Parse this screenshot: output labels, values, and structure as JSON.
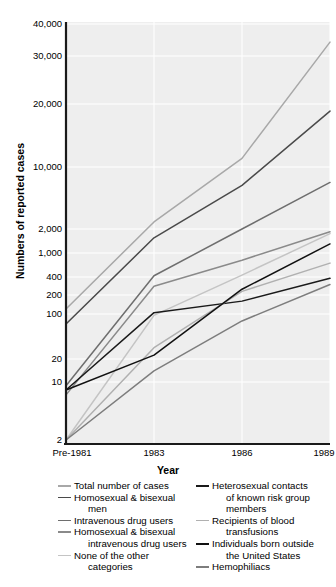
{
  "chart": {
    "ylabel": "Numbers of reported cases",
    "xlabel": "Year",
    "y_ticks": [
      "40,000",
      "30,000",
      "20,000",
      "10,000",
      "2,000",
      "1,000",
      "400",
      "200",
      "100",
      "20",
      "10",
      "2"
    ],
    "x_ticks": [
      "Pre-1981",
      "1983",
      "1986",
      "1989"
    ]
  },
  "legend": {
    "left": [
      {
        "label": "Total number of cases",
        "cont": "",
        "color": "#a8a8a8"
      },
      {
        "label": "Homosexual & bisexual",
        "cont": "men",
        "color": "#4a4a4a"
      },
      {
        "label": "Intravenous drug users",
        "cont": "",
        "color": "#6e6e6e"
      },
      {
        "label": "Homosexual & bisexual",
        "cont": "intravenous drug users",
        "color": "#8a8a8a"
      },
      {
        "label": "None of the other",
        "cont": "categories",
        "color": "#c4c4c4"
      }
    ],
    "right": [
      {
        "label": "Heterosexual contacts",
        "cont": "of known risk group|members",
        "color": "#1a1a1a"
      },
      {
        "label": "Recipients of blood",
        "cont": "transfusions",
        "color": "#b0b0b0"
      },
      {
        "label": "Individuals born outside",
        "cont": "the United States",
        "color": "#111111"
      },
      {
        "label": "Hemophiliacs",
        "cont": "",
        "color": "#7d7d7d"
      }
    ]
  },
  "chart_data": {
    "type": "line",
    "title": "",
    "xlabel": "Year",
    "ylabel": "Numbers of reported cases",
    "yscale": "log-custom",
    "categories": [
      "Pre-1981",
      "1983",
      "1986",
      "1989"
    ],
    "ytick_values": [
      40000,
      30000,
      20000,
      10000,
      2000,
      1000,
      400,
      200,
      100,
      20,
      10,
      2
    ],
    "ytick_labels": [
      "40,000",
      "30,000",
      "20,000",
      "10,000",
      "2,000",
      "1,000",
      "400",
      "200",
      "100",
      "20",
      "10",
      "2"
    ],
    "ylim": [
      2,
      40000
    ],
    "grid": true,
    "legend_position": "below",
    "series": [
      {
        "name": "Total number of cases",
        "color": "#a8a8a8",
        "values": [
          120,
          2400,
          11000,
          34000
        ]
      },
      {
        "name": "Homosexual & bisexual men",
        "color": "#4a4a4a",
        "values": [
          70,
          1550,
          6200,
          18500
        ]
      },
      {
        "name": "Intravenous drug users",
        "color": "#6e6e6e",
        "values": [
          9,
          420,
          2000,
          6700
        ]
      },
      {
        "name": "Homosexual & bisexual intravenous drug users",
        "color": "#8a8a8a",
        "values": [
          7,
          280,
          760,
          1850
        ]
      },
      {
        "name": "None of the other categories",
        "color": "#c4c4c4",
        "values": [
          2,
          95,
          430,
          1750
        ]
      },
      {
        "name": "Heterosexual contacts of known risk group members",
        "color": "#1a1a1a",
        "values": [
          8,
          105,
          160,
          380
        ]
      },
      {
        "name": "Recipients of blood transfusions",
        "color": "#b0b0b0",
        "values": [
          2,
          30,
          230,
          680
        ]
      },
      {
        "name": "Individuals born outside the United States",
        "color": "#111111",
        "values": [
          8,
          23,
          250,
          1300
        ]
      },
      {
        "name": "Hemophiliacs",
        "color": "#7d7d7d",
        "values": [
          2,
          14,
          78,
          300
        ]
      }
    ]
  }
}
